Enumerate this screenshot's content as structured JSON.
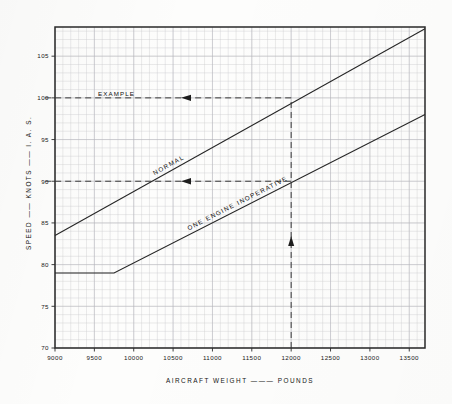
{
  "chart_data": {
    "type": "line",
    "title": "",
    "xlabel": "AIRCRAFT     WEIGHT   ———   POUNDS",
    "ylabel": "SPEED  ——  KNOTS  ——  I. A. S.",
    "xlim": [
      9000,
      13700
    ],
    "ylim": [
      70,
      108.5
    ],
    "xticks": [
      9000,
      9500,
      10000,
      10500,
      11000,
      11500,
      12000,
      12500,
      13000,
      13500
    ],
    "xtick_labels": [
      "9000",
      "9500",
      "10000",
      "10500",
      "11000",
      "11500",
      "12000",
      "12500",
      "13000",
      "13500"
    ],
    "yticks": [
      70,
      75,
      80,
      85,
      90,
      95,
      100,
      105
    ],
    "ytick_labels": [
      "70",
      "75",
      "80",
      "85",
      "90",
      "95",
      "100",
      "105"
    ],
    "grid": true,
    "grid_minor_x_step": 100,
    "grid_minor_y_step": 1,
    "legend_position": "inline-on-curves",
    "series": [
      {
        "name": "NORMAL",
        "label": "NORMAL",
        "points": [
          {
            "x": 9000,
            "y": 83.5
          },
          {
            "x": 13700,
            "y": 108.3
          }
        ]
      },
      {
        "name": "ONE ENGINE INOPERATIVE",
        "label": "ONE  ENGINE  INOPERATIVE",
        "points": [
          {
            "x": 9000,
            "y": 79.0
          },
          {
            "x": 9750,
            "y": 79.0
          },
          {
            "x": 13700,
            "y": 98.0
          }
        ]
      }
    ],
    "annotations": [
      {
        "name": "example",
        "label": "EXAMPLE",
        "weight": 12000,
        "normal_speed": 100,
        "one_engine_inoperative_speed": 90,
        "description": "Vertical construction line at 12000 pounds rising to intersect both curves; horizontal construction lines read 100 knots on NORMAL and 90 knots on ONE ENGINE INOPERATIVE."
      }
    ]
  },
  "axes": {
    "y_title_parts": [
      "SPEED",
      "——",
      "KNOTS",
      "——",
      "I. A. S."
    ],
    "x_title_parts": [
      "AIRCRAFT",
      "WEIGHT",
      "———",
      "POUNDS"
    ]
  },
  "labels": {
    "example": "EXAMPLE",
    "normal": "NORMAL",
    "one_engine_inoperative": "ONE  ENGINE  INOPERATIVE"
  },
  "colors": {
    "paper": "#fdfdfc",
    "ink": "#262626",
    "grid": "#c9c9cd",
    "frame": "#2a2a2a"
  }
}
